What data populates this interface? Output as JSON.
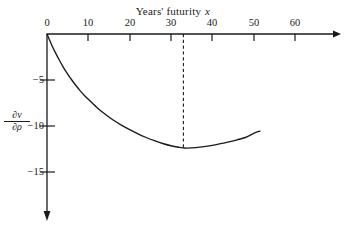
{
  "chart_data": {
    "type": "line",
    "title": "Years' futurity",
    "title_variable": "x",
    "xlabel": "Years' futurity x",
    "ylabel": "∂v/∂ρ",
    "ylabel_numerator": "∂v",
    "ylabel_denominator": "∂ρ",
    "xlim": [
      0,
      62
    ],
    "ylim": [
      -17.5,
      0
    ],
    "xticks": [
      0,
      10,
      20,
      30,
      40,
      50,
      60
    ],
    "xtick_labels": [
      "0",
      "10",
      "20",
      "30",
      "40",
      "50",
      "60"
    ],
    "yticks": [
      -5,
      -10,
      -15
    ],
    "ytick_labels": [
      "−5",
      "−10",
      "−15"
    ],
    "grid": false,
    "legend": null,
    "axis_arrows": {
      "x": "right",
      "y": "down"
    },
    "x_axis_position": "top",
    "series": [
      {
        "name": "dv/drho",
        "color": "#1a1a1a",
        "x": [
          0,
          1,
          2,
          3,
          4,
          5,
          6,
          7,
          8,
          9,
          10,
          12,
          14,
          16,
          18,
          20,
          22,
          24,
          26,
          28,
          30,
          32,
          33,
          34,
          36,
          38,
          40,
          42,
          44,
          46,
          48,
          50,
          51.5
        ],
        "values": [
          0,
          -1.05,
          -2.0,
          -2.85,
          -3.65,
          -4.35,
          -5.0,
          -5.6,
          -6.15,
          -6.65,
          -7.1,
          -7.95,
          -8.7,
          -9.35,
          -9.9,
          -10.4,
          -10.85,
          -11.25,
          -11.6,
          -11.9,
          -12.15,
          -12.32,
          -12.38,
          -12.4,
          -12.35,
          -12.25,
          -12.1,
          -11.92,
          -11.72,
          -11.5,
          -11.25,
          -10.8,
          -10.55
        ]
      }
    ],
    "annotations": [
      {
        "type": "vertical-dashed-line",
        "x": 33,
        "y_from": 0,
        "y_to": -12.38,
        "label": null
      }
    ],
    "minimum_point": {
      "x": 33,
      "y": -12.4
    }
  }
}
